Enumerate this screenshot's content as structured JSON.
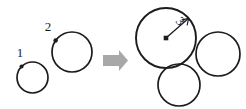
{
  "figure": {
    "background_color": "#ffffff",
    "stroke_color": "#1c1c1c",
    "arrow_color": "#a8a8a8",
    "width": 246,
    "height": 109
  },
  "labels": {
    "circle_one": "1",
    "circle_two": "2",
    "circle_three": "3"
  },
  "left_group": {
    "circles": [
      {
        "label": "1",
        "cx": 32.5,
        "cy": 77.5,
        "r": 15.5,
        "stroke_width": 1.7,
        "marker_angle_deg": 225,
        "marker_r": 2.0,
        "label_x": 20,
        "label_y": 57
      },
      {
        "label": "2",
        "cx": 72,
        "cy": 52,
        "r": 20,
        "stroke_width": 1.7,
        "marker_angle_deg": 215,
        "marker_r": 2.2,
        "label_x": 44,
        "label_y": 31
      }
    ]
  },
  "transform_arrow": {
    "name": "right-block-arrow",
    "shaft_x": 103,
    "shaft_y": 55,
    "shaft_w": 16,
    "shaft_h": 11,
    "head_tip_x": 128,
    "head_top_y": 50,
    "head_bottom_y": 71,
    "color": "#a8a8a8"
  },
  "right_group": {
    "main_circle": {
      "label": "3",
      "cx": 166,
      "cy": 38,
      "r": 30,
      "stroke_width": 1.9,
      "center_dot_r": 2.2,
      "radius_angle_deg": -41,
      "label_x": 176,
      "label_y": 22,
      "label_rotation_deg": 50
    },
    "satellite_circles": [
      {
        "name": "right-satellite-circle",
        "cx": 218,
        "cy": 54,
        "r": 22,
        "stroke_width": 1.7
      },
      {
        "name": "bottom-satellite-circle",
        "cx": 179,
        "cy": 85,
        "r": 21,
        "stroke_width": 1.7
      }
    ]
  }
}
